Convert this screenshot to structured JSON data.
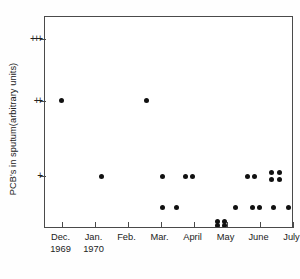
{
  "chart_data": {
    "type": "scatter",
    "title": "",
    "xlabel": "",
    "ylabel": "PCB's in sputum(arbitrary units)",
    "grid": false,
    "legend": null,
    "x_tick_labels": [
      "Dec.",
      "Jan.",
      "Feb.",
      "Mar.",
      "April",
      "May",
      "June",
      "July"
    ],
    "x_year_labels": [
      {
        "under": "Dec.",
        "text": "1969"
      },
      {
        "under": "Jan.",
        "text": "1970"
      }
    ],
    "y_tick_labels": [
      "+",
      "++",
      "+++"
    ],
    "y_scale_note": "ordinal semi-quantitative scale",
    "points": [
      {
        "x": "Dec.",
        "y": "++"
      },
      {
        "x": "Jan.",
        "y": "+"
      },
      {
        "x": "Mar.",
        "y": "++"
      },
      {
        "x": "Feb.",
        "y": "+"
      },
      {
        "x": "Feb.",
        "y": "+"
      },
      {
        "x": "Feb.",
        "y": "+"
      },
      {
        "x": "Feb.",
        "y": "0+"
      },
      {
        "x": "Feb.",
        "y": "0+"
      },
      {
        "x": "May",
        "y": "+"
      },
      {
        "x": "May",
        "y": "+"
      },
      {
        "x": "May",
        "y": "+"
      },
      {
        "x": "May",
        "y": "+"
      },
      {
        "x": "May",
        "y": "+"
      },
      {
        "x": "May",
        "y": "+"
      },
      {
        "x": "May",
        "y": "0+"
      },
      {
        "x": "May",
        "y": "0+"
      },
      {
        "x": "May",
        "y": "0+"
      },
      {
        "x": "June",
        "y": "0+"
      },
      {
        "x": "June",
        "y": "0"
      },
      {
        "x": "June",
        "y": "0"
      },
      {
        "x": "June",
        "y": "0"
      },
      {
        "x": "June",
        "y": "0"
      },
      {
        "x": "July",
        "y": "0+"
      }
    ],
    "pixel_points": [
      {
        "cx": 16.5,
        "cy": 83.5
      },
      {
        "cx": 56.0,
        "cy": 159.0
      },
      {
        "cx": 101.0,
        "cy": 83.5
      },
      {
        "cx": 117.0,
        "cy": 159.0
      },
      {
        "cx": 140.5,
        "cy": 159.0
      },
      {
        "cx": 147.5,
        "cy": 159.0
      },
      {
        "cx": 117.5,
        "cy": 190.5
      },
      {
        "cx": 131.0,
        "cy": 190.5
      },
      {
        "cx": 202.5,
        "cy": 159.0
      },
      {
        "cx": 209.5,
        "cy": 159.0
      },
      {
        "cx": 226.5,
        "cy": 155.5
      },
      {
        "cx": 234.0,
        "cy": 155.5
      },
      {
        "cx": 226.5,
        "cy": 162.5
      },
      {
        "cx": 234.0,
        "cy": 162.5
      },
      {
        "cx": 190.0,
        "cy": 190.5
      },
      {
        "cx": 207.0,
        "cy": 190.5
      },
      {
        "cx": 214.0,
        "cy": 190.5
      },
      {
        "cx": 228.5,
        "cy": 190.5
      },
      {
        "cx": 172.5,
        "cy": 208.0
      },
      {
        "cx": 179.5,
        "cy": 208.0
      },
      {
        "cx": 172.5,
        "cy": 204.5
      },
      {
        "cx": 179.5,
        "cy": 204.5
      },
      {
        "cx": 243.5,
        "cy": 190.5
      }
    ],
    "axis": {
      "x_tick_positions": [
        16.5,
        49.5,
        82.5,
        115.5,
        148.5,
        181.5,
        214.5,
        247.5
      ],
      "y_tick_positions": [
        159.0,
        83.5,
        22.0
      ]
    }
  },
  "figure": {
    "y_axis_title": "PCB's in sputum(arbitrary units)"
  }
}
